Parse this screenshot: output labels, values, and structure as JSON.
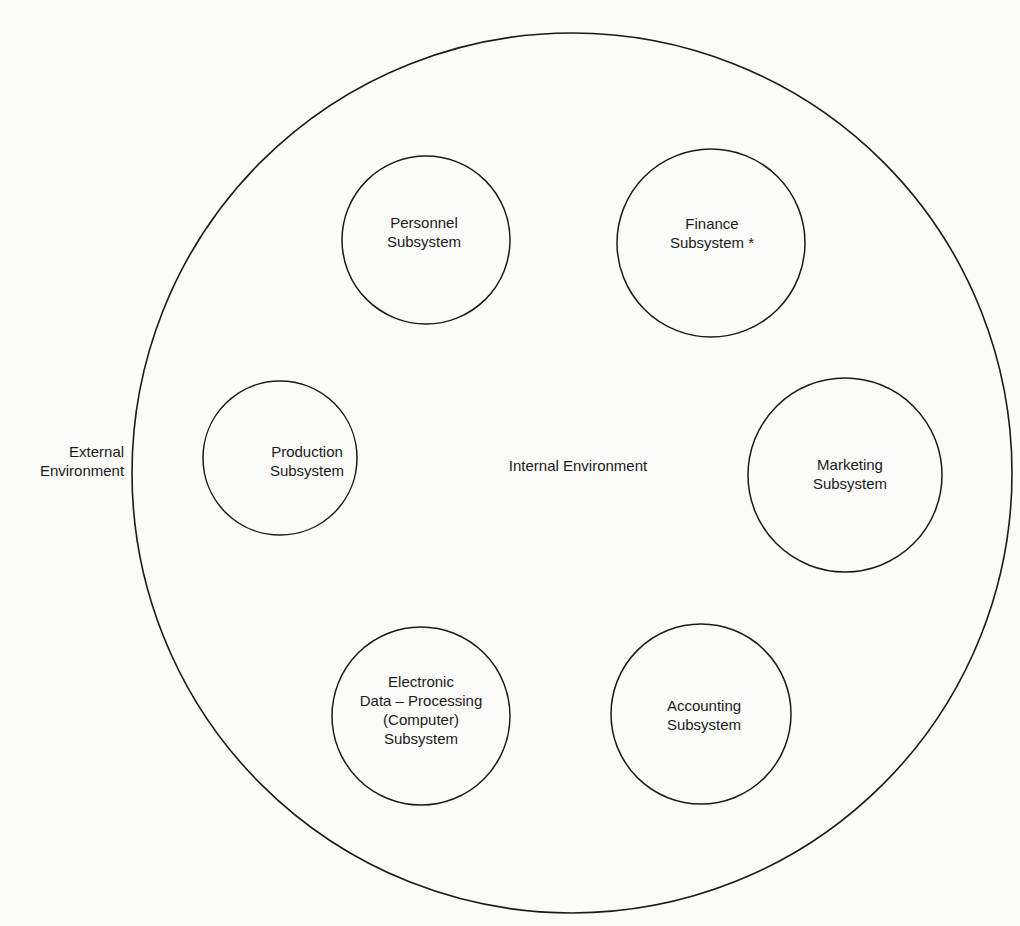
{
  "diagram": {
    "outer": {
      "label_inside": "Internal Environment",
      "label_outside_lines": [
        "External",
        "Environment"
      ]
    },
    "subsystems": [
      {
        "id": "personnel",
        "lines": [
          "Personnel",
          "Subsystem"
        ]
      },
      {
        "id": "finance",
        "lines": [
          "Finance",
          "Subsystem *"
        ]
      },
      {
        "id": "production",
        "lines": [
          "Production",
          "Subsystem"
        ]
      },
      {
        "id": "marketing",
        "lines": [
          "Marketing",
          "Subsystem"
        ]
      },
      {
        "id": "edp",
        "lines": [
          "Electronic",
          "Data – Processing",
          "(Computer)",
          "Subsystem"
        ]
      },
      {
        "id": "accounting",
        "lines": [
          "Accounting",
          "Subsystem"
        ]
      }
    ],
    "colors": {
      "stroke": "#1a1a1a",
      "background": "#fbfbfa"
    }
  }
}
